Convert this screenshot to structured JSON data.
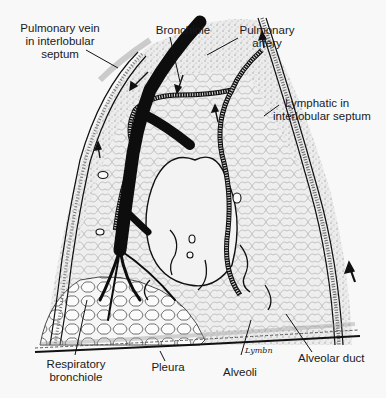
{
  "figure": {
    "labels": {
      "pulmonary_vein": {
        "line1": "Pulmonary vein",
        "line2": "in interlobular",
        "line3": "septum"
      },
      "bronchiole": {
        "line1": "Bronchiole"
      },
      "pulmonary_artery": {
        "line1": "Pulmonary",
        "line2": "artery"
      },
      "lymphatic": {
        "line1": "Lymphatic in",
        "line2": "interlobular septum"
      },
      "respiratory_bronchiole": {
        "line1": "Respiratory",
        "line2": "bronchiole"
      },
      "pleura": {
        "line1": "Pleura"
      },
      "alveoli": {
        "line1": "Alveoli"
      },
      "alveolar_duct": {
        "line1": "Alveolar duct"
      }
    },
    "signature": "Lymbn",
    "colors": {
      "background": "#f8f8f8",
      "ink": "#111111",
      "stipple": "#c9c9c9",
      "tissue": "#e6e6e6",
      "text": "#1a1a1a"
    }
  }
}
